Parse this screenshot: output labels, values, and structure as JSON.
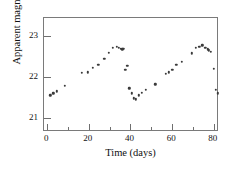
{
  "chart_data": {
    "type": "scatter",
    "title": "",
    "xlabel": "Time (days)",
    "ylabel": "Apparent magnitude",
    "xlim": [
      -1.5,
      82.5
    ],
    "ylim": [
      23.45,
      20.65
    ],
    "y_inverted": true,
    "grid": false,
    "legend": null,
    "xticks": [
      0,
      20,
      40,
      60,
      80
    ],
    "xticks_minor": [
      10,
      30,
      50,
      70
    ],
    "yticks": [
      21,
      22,
      23
    ],
    "xtick_labels": [
      "0",
      "20",
      "40",
      "60",
      "80"
    ],
    "ytick_labels": [
      "21",
      "22",
      "23"
    ],
    "marker": "filled-circle",
    "marker_color": "#3a3a3a",
    "frame_color": "#7a7a7a",
    "background": "#ffffff",
    "series": [
      {
        "name": "Cepheid light curve",
        "x": [
          1.5,
          3.0,
          4.5,
          8.5,
          16.5,
          19.5,
          22.0,
          24.5,
          27.5,
          29.5,
          31.5,
          33.5,
          34.5,
          35.5,
          36.0,
          36.5,
          37.5,
          38.5,
          39.5,
          40.5,
          41.5,
          42.5,
          44.0,
          45.5,
          47.5,
          52.0,
          57.0,
          58.5,
          60.0,
          62.0,
          64.5,
          69.5,
          71.5,
          73.0,
          74.5,
          76.0,
          77.0,
          77.5,
          78.5,
          80.0,
          81.0,
          82.0
        ],
        "y": [
          21.55,
          21.6,
          21.65,
          21.78,
          22.1,
          22.12,
          22.22,
          22.3,
          22.45,
          22.6,
          22.72,
          22.75,
          22.72,
          22.7,
          22.68,
          22.7,
          22.18,
          22.28,
          21.72,
          21.6,
          21.48,
          21.45,
          21.55,
          21.62,
          21.68,
          21.82,
          22.08,
          22.12,
          22.18,
          22.3,
          22.38,
          22.58,
          22.72,
          22.75,
          22.78,
          22.72,
          22.68,
          22.66,
          22.62,
          22.2,
          21.68,
          21.6
        ]
      }
    ]
  }
}
